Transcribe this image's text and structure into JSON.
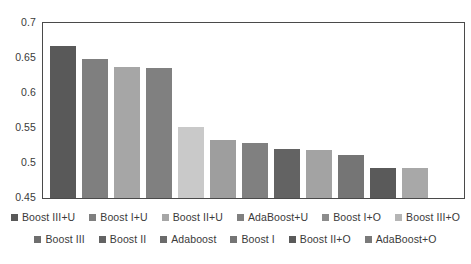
{
  "chart_data": {
    "type": "bar",
    "title": "",
    "subtitle": "",
    "xlabel": "",
    "ylabel": "",
    "ylim": [
      0.45,
      0.7
    ],
    "ytick_labels": [
      "0.7",
      "0.65",
      "0.6",
      "0.55",
      "0.5",
      "0.45"
    ],
    "ytick_values": [
      0.7,
      0.65,
      0.6,
      0.55,
      0.5,
      0.45
    ],
    "grid": false,
    "legend_position": "bottom",
    "categories": [
      "Boost III+U",
      "Boost I+U",
      "Boost II+U",
      "AdaBoost+U",
      "Boost I+O",
      "Boost III+O",
      "Boost III",
      "Boost II",
      "Adaboost",
      "Boost I",
      "Boost II+O",
      "AdaBoost+O"
    ],
    "values": [
      0.667,
      0.648,
      0.637,
      0.636,
      0.552,
      0.533,
      0.529,
      0.52,
      0.519,
      0.511,
      0.493,
      0.493
    ],
    "colors": [
      "#595959",
      "#7f7f7f",
      "#a6a6a6",
      "#808080",
      "#c9c9c9",
      "#9e9e9e",
      "#808080",
      "#636363",
      "#a3a3a3",
      "#757575",
      "#5a5a5a",
      "#a8a8a8"
    ]
  },
  "legend": {
    "rows": [
      [
        {
          "label": "Boost III+U",
          "color": "#595959"
        },
        {
          "label": "Boost I+U",
          "color": "#7f7f7f"
        },
        {
          "label": "Boost II+U",
          "color": "#a6a6a6"
        },
        {
          "label": "AdaBoost+U",
          "color": "#808080"
        },
        {
          "label": "Boost I+O",
          "color": "#8c8c8c"
        },
        {
          "label": "Boost III+O",
          "color": "#b5b5b5"
        }
      ],
      [
        {
          "label": "Boost III",
          "color": "#6e6e6e"
        },
        {
          "label": "Boost II",
          "color": "#636363"
        },
        {
          "label": "Adaboost",
          "color": "#6b6b6b"
        },
        {
          "label": "Boost I",
          "color": "#757575"
        },
        {
          "label": "Boost II+O",
          "color": "#5a5a5a"
        },
        {
          "label": "AdaBoost+O",
          "color": "#7a7a7a"
        }
      ]
    ]
  },
  "axis": {
    "min": 0.45,
    "max": 0.7
  }
}
